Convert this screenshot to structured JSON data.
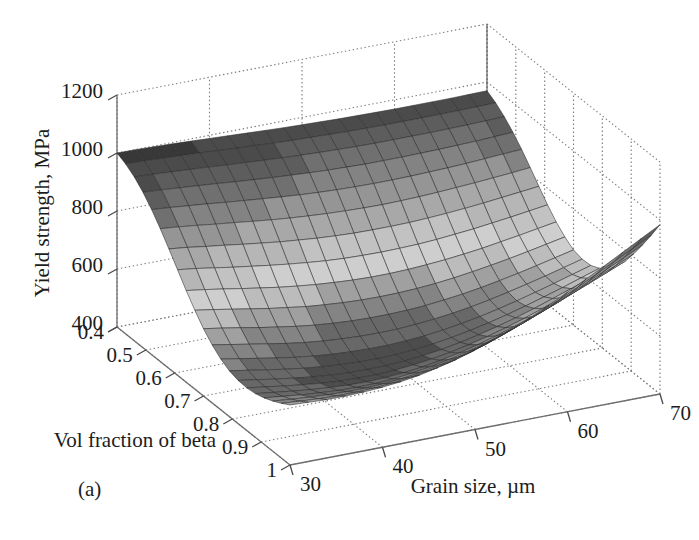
{
  "figure": {
    "panel_label": "(a)",
    "background": "#ffffff"
  },
  "chart_data": {
    "type": "surface",
    "title": "",
    "xlabel": "Grain size, µm",
    "ylabel": "Vol fraction of beta",
    "zlabel": "Yield strength, MPa",
    "xlim": [
      30,
      70
    ],
    "ylim": [
      0.4,
      1
    ],
    "zlim": [
      400,
      1200
    ],
    "xticks": [
      30,
      40,
      50,
      60,
      70
    ],
    "yticks": [
      0.4,
      0.5,
      0.6,
      0.7,
      0.8,
      0.9,
      1
    ],
    "zticks": [
      400,
      600,
      800,
      1000,
      1200
    ],
    "xtick_labels": [
      "30",
      "40",
      "50",
      "60",
      "70"
    ],
    "ytick_labels": [
      "0.4",
      "0.5",
      "0.6",
      "0.7",
      "0.8",
      "0.9",
      "1"
    ],
    "ztick_labels": [
      "400",
      "600",
      "800",
      "1000",
      "1200"
    ],
    "grid": true,
    "grid_style": "dotted",
    "legend": null,
    "colormap": "gray",
    "mesh": true,
    "view": {
      "azimuth": -37.5,
      "elevation": 30
    },
    "x": [
      30,
      32,
      34,
      36,
      38,
      40,
      42,
      44,
      46,
      48,
      50,
      52,
      54,
      56,
      58,
      60,
      62,
      64,
      66,
      68,
      70
    ],
    "y": [
      0.4,
      0.43,
      0.46,
      0.49,
      0.52,
      0.55,
      0.58,
      0.61,
      0.64,
      0.67,
      0.7,
      0.73,
      0.76,
      0.79,
      0.82,
      0.85,
      0.88,
      0.91,
      0.94,
      0.97,
      1.0
    ],
    "z": [
      [
        1000,
        999,
        997,
        995,
        992,
        989,
        986,
        983,
        980,
        977,
        975,
        973,
        971,
        970,
        969,
        968,
        968,
        968,
        968,
        969,
        970
      ],
      [
        986,
        984,
        981,
        978,
        975,
        971,
        967,
        964,
        960,
        957,
        955,
        953,
        951,
        950,
        949,
        949,
        949,
        949,
        950,
        951,
        952
      ],
      [
        965,
        962,
        958,
        954,
        950,
        945,
        941,
        937,
        933,
        930,
        927,
        925,
        923,
        922,
        922,
        922,
        922,
        923,
        924,
        926,
        928
      ],
      [
        936,
        932,
        927,
        922,
        917,
        911,
        906,
        901,
        897,
        893,
        890,
        888,
        886,
        886,
        886,
        887,
        888,
        890,
        892,
        895,
        898
      ],
      [
        900,
        895,
        889,
        883,
        876,
        870,
        864,
        858,
        853,
        849,
        846,
        844,
        843,
        843,
        844,
        846,
        848,
        851,
        855,
        859,
        863
      ],
      [
        858,
        852,
        845,
        837,
        830,
        822,
        815,
        809,
        804,
        800,
        797,
        795,
        794,
        795,
        797,
        800,
        804,
        808,
        813,
        818,
        824
      ],
      [
        812,
        805,
        796,
        788,
        779,
        771,
        763,
        757,
        751,
        747,
        744,
        743,
        743,
        744,
        747,
        751,
        756,
        762,
        769,
        776,
        783
      ],
      [
        764,
        756,
        746,
        736,
        727,
        718,
        710,
        703,
        697,
        693,
        691,
        690,
        691,
        693,
        697,
        703,
        709,
        717,
        725,
        734,
        743
      ],
      [
        716,
        707,
        697,
        686,
        676,
        666,
        658,
        651,
        646,
        642,
        640,
        640,
        642,
        646,
        651,
        658,
        666,
        676,
        686,
        697,
        708
      ],
      [
        672,
        662,
        651,
        640,
        629,
        620,
        611,
        605,
        600,
        597,
        596,
        597,
        600,
        605,
        612,
        621,
        631,
        642,
        654,
        667,
        680
      ],
      [
        632,
        622,
        611,
        599,
        589,
        579,
        571,
        565,
        561,
        559,
        559,
        561,
        565,
        572,
        580,
        590,
        602,
        615,
        629,
        644,
        659
      ],
      [
        600,
        589,
        578,
        567,
        556,
        547,
        540,
        535,
        532,
        531,
        532,
        536,
        542,
        550,
        560,
        572,
        586,
        601,
        617,
        634,
        651
      ],
      [
        575,
        564,
        553,
        542,
        532,
        524,
        518,
        514,
        512,
        512,
        515,
        520,
        528,
        538,
        550,
        564,
        580,
        597,
        615,
        634,
        653
      ],
      [
        558,
        548,
        537,
        527,
        518,
        511,
        506,
        503,
        502,
        504,
        509,
        516,
        526,
        538,
        552,
        568,
        586,
        605,
        625,
        646,
        667
      ],
      [
        549,
        539,
        529,
        520,
        512,
        506,
        502,
        501,
        502,
        506,
        512,
        521,
        533,
        547,
        563,
        581,
        601,
        623,
        645,
        668,
        691
      ],
      [
        547,
        538,
        529,
        521,
        514,
        509,
        507,
        507,
        510,
        516,
        524,
        535,
        549,
        565,
        583,
        603,
        625,
        649,
        673,
        698,
        723
      ],
      [
        551,
        543,
        535,
        528,
        523,
        519,
        518,
        520,
        525,
        532,
        543,
        556,
        572,
        590,
        611,
        633,
        657,
        683,
        709,
        736,
        763
      ],
      [
        560,
        553,
        546,
        541,
        537,
        535,
        536,
        540,
        547,
        557,
        570,
        585,
        603,
        624,
        647,
        672,
        698,
        726,
        755,
        784,
        813
      ],
      [
        573,
        567,
        562,
        558,
        556,
        556,
        559,
        565,
        574,
        586,
        601,
        619,
        640,
        663,
        688,
        715,
        744,
        774,
        805,
        836,
        867
      ],
      [
        589,
        584,
        580,
        578,
        578,
        580,
        585,
        593,
        604,
        618,
        636,
        656,
        679,
        705,
        733,
        762,
        793,
        825,
        858,
        891,
        924
      ],
      [
        607,
        604,
        601,
        601,
        603,
        607,
        614,
        624,
        638,
        654,
        674,
        697,
        722,
        750,
        780,
        812,
        845,
        879,
        914,
        949,
        984
      ]
    ]
  }
}
